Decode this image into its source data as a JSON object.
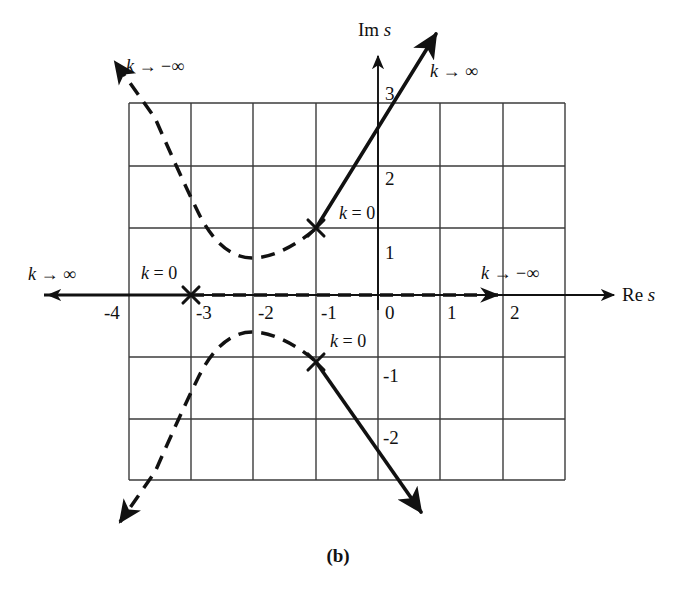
{
  "figure": {
    "caption": "(b)",
    "axes": {
      "x_axis_label": "Re s",
      "y_axis_label": "Im s",
      "x_ticks": [
        "-4",
        "-3",
        "-2",
        "-1",
        "0",
        "1",
        "2"
      ],
      "y_ticks": [
        "3",
        "2",
        "1",
        "-1",
        "-2"
      ]
    },
    "annotations": {
      "k_zero_upper_pole": "k = 0",
      "k_zero_real_pole": "k = 0",
      "k_zero_lower_pole": "k = 0",
      "k_to_neg_inf_upper_left": "k → −∞",
      "k_to_pos_inf_upper_right": "k → ∞",
      "k_to_pos_inf_left": "k → ∞",
      "k_to_neg_inf_right": "k → −∞"
    },
    "colors": {
      "grid": "#3b3b3b",
      "axis": "#111111",
      "locus_positive_k": "#111111",
      "locus_negative_k": "#111111"
    }
  },
  "chart_data": {
    "type": "scatter",
    "title": "",
    "subtitle": "(b)",
    "xlabel": "Re s",
    "ylabel": "Im s",
    "xlim": [
      -4.3,
      2.7
    ],
    "ylim": [
      -2.6,
      3.5
    ],
    "grid": true,
    "grid_spacing": 1,
    "legend": "none",
    "xticks": [
      -4,
      -3,
      -2,
      -1,
      0,
      1,
      2
    ],
    "yticks": [
      3,
      2,
      1,
      -1,
      -2
    ],
    "poles": [
      {
        "label": "k = 0",
        "re": -1,
        "im": 1.5,
        "marker": "x"
      },
      {
        "label": "k = 0",
        "re": -3,
        "im": 0,
        "marker": "x"
      },
      {
        "label": "k = 0",
        "re": -1,
        "im": -1.5,
        "marker": "x"
      }
    ],
    "branches": [
      {
        "name": "positive-k-upper-branch",
        "style": "solid",
        "k_direction": "k → ∞",
        "points": [
          [
            -1,
            1.5
          ],
          [
            -0.6,
            2.2
          ],
          [
            -0.2,
            2.9
          ],
          [
            0.1,
            3.5
          ]
        ],
        "arrow_at": [
          0.1,
          3.5
        ]
      },
      {
        "name": "positive-k-lower-branch",
        "style": "solid",
        "k_direction": "k → ∞",
        "points": [
          [
            -1,
            -1.5
          ],
          [
            -0.6,
            -2.2
          ],
          [
            -0.2,
            -2.9
          ],
          [
            0.1,
            -3.4
          ]
        ],
        "arrow_at": [
          0.1,
          -3.4
        ]
      },
      {
        "name": "positive-k-real-branch",
        "style": "solid",
        "k_direction": "k → ∞",
        "points": [
          [
            -3,
            0
          ],
          [
            -4.3,
            0
          ]
        ],
        "arrow_at": [
          -5.5,
          0
        ]
      },
      {
        "name": "negative-k-upper-branch",
        "style": "dashed",
        "k_direction": "k → −∞",
        "points": [
          [
            -1,
            1.5
          ],
          [
            -1.5,
            1.3
          ],
          [
            -2.1,
            1.22
          ],
          [
            -2.6,
            1.5
          ],
          [
            -3.1,
            2.2
          ],
          [
            -3.6,
            3.0
          ],
          [
            -4.0,
            3.6
          ]
        ],
        "arrow_at": [
          -4.0,
          3.6
        ]
      },
      {
        "name": "negative-k-lower-branch",
        "style": "dashed",
        "k_direction": "k → −∞",
        "points": [
          [
            -1,
            -1.5
          ],
          [
            -1.5,
            -1.3
          ],
          [
            -2.1,
            -1.22
          ],
          [
            -2.6,
            -1.5
          ],
          [
            -3.1,
            -2.2
          ],
          [
            -3.6,
            -3.0
          ],
          [
            -4.0,
            -3.6
          ]
        ],
        "arrow_at": [
          -4.0,
          -3.6
        ]
      },
      {
        "name": "negative-k-real-branch",
        "style": "dashed",
        "k_direction": "k → −∞",
        "points": [
          [
            -3,
            0
          ],
          [
            2.0,
            0
          ]
        ],
        "arrow_at": [
          2.1,
          0
        ]
      }
    ]
  }
}
